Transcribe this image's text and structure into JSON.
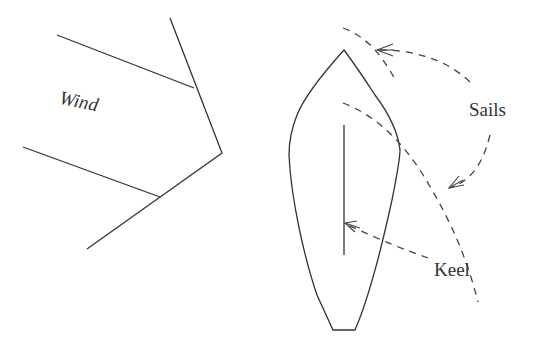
{
  "diagram": {
    "type": "sailboat-wind-diagram",
    "labels": {
      "wind": "Wind",
      "sails": "Sails",
      "keel": "Keel"
    },
    "colors": {
      "background": "#ffffff",
      "stroke": "#333333",
      "text": "#333333"
    },
    "elements": [
      {
        "id": "wind-arrow",
        "description": "Large open arrow pointing right/down-right toward the boat, labeled Wind"
      },
      {
        "id": "boat-hull",
        "description": "Top-down outline of a sailboat hull, pointed bow at top, flat stern at bottom"
      },
      {
        "id": "keel-line",
        "description": "Vertical line along boat centerline representing the keel"
      },
      {
        "id": "sail-upper",
        "description": "Dashed curved line near the bow representing the jib sail"
      },
      {
        "id": "sail-lower",
        "description": "Dashed curved line from mid-boat extending down-right representing the main sail"
      },
      {
        "id": "sails-pointer-upper",
        "description": "Dashed arrow from Sails label to upper sail"
      },
      {
        "id": "sails-pointer-lower",
        "description": "Dashed arrow from Sails label to lower sail"
      },
      {
        "id": "keel-pointer",
        "description": "Dashed arrow from Keel label to keel line"
      }
    ]
  }
}
